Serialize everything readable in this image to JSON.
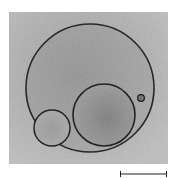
{
  "figure": {
    "type": "micrograph",
    "colors": {
      "background": "#ffffff",
      "field_light": "#bdbdbd",
      "field_dark": "#8f8f8f",
      "membrane": "#2a2a2a",
      "scale_bar": "#222222"
    },
    "objects": [
      {
        "name": "outer-vesicle",
        "label": ""
      },
      {
        "name": "inner-vesicle-large",
        "label": ""
      },
      {
        "name": "inner-vesicle-small",
        "label": ""
      },
      {
        "name": "particle",
        "label": ""
      }
    ],
    "scale_bar": {
      "label": ""
    }
  }
}
